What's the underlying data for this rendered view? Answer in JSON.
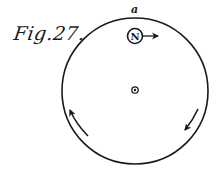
{
  "figure": {
    "caption": "Fig.27.",
    "point_label": "a",
    "magnet_pole_label": "N",
    "colors": {
      "ink": "#1a1a1a",
      "background": "#ffffff"
    },
    "disc": {
      "cx": 135,
      "cy": 91,
      "r": 73
    },
    "center_pivot": {
      "cx": 135,
      "cy": 90
    },
    "pole_marker": {
      "cx": 135,
      "cy": 36,
      "r": 7.5,
      "arrow_direction": "right"
    },
    "rotation_arrows": [
      {
        "side": "left",
        "direction": "up"
      },
      {
        "side": "right",
        "direction": "down"
      }
    ]
  }
}
